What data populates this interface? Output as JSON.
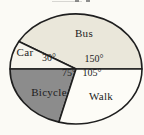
{
  "figure": {
    "background": "#fbfaf5",
    "outline_color": "#1f1f1f",
    "text_color": "#1c1c1c"
  },
  "chart_data": {
    "type": "pie",
    "title": "",
    "unit": "degrees",
    "start_angle_deg": 0,
    "direction": "counterclockwise",
    "categories": [
      "Bus",
      "Car",
      "Bicycle",
      "Walk"
    ],
    "values": [
      150,
      30,
      75,
      105
    ],
    "slices": [
      {
        "label": "Bus",
        "angle_deg": 150,
        "angle_label": "150°",
        "color": "#eae7da"
      },
      {
        "label": "Car",
        "angle_deg": 30,
        "angle_label": "30°",
        "color": "#f6f4ec"
      },
      {
        "label": "Bicycle",
        "angle_deg": 75,
        "angle_label": "75°",
        "color": "#8c8c8c"
      },
      {
        "label": "Walk",
        "angle_deg": 105,
        "angle_label": "105°",
        "color": "#fdfcf7"
      }
    ]
  }
}
